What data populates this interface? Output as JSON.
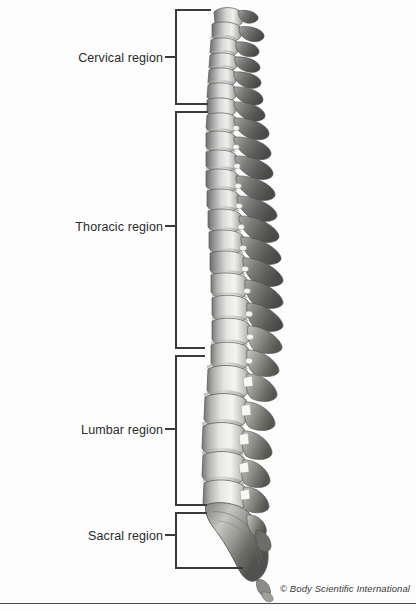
{
  "figure": {
    "copyright": "© Body Scientific International",
    "background_color": "#fdfdfd",
    "line_color": "#3b3b3b",
    "text_color": "#2b2b2b"
  },
  "labels": [
    {
      "id": "cervical",
      "text": "Cervical region",
      "text_right_x": 163,
      "text_center_y": 58,
      "tick_y": 57,
      "bracket_top_y": 10,
      "bracket_bottom_y": 104,
      "arm_top_x": 211,
      "arm_bottom_x": 208
    },
    {
      "id": "thoracic",
      "text": "Thoracic region",
      "text_right_x": 163,
      "text_center_y": 227,
      "tick_y": 226,
      "bracket_top_y": 112,
      "bracket_bottom_y": 348,
      "arm_top_x": 208,
      "arm_bottom_x": 205
    },
    {
      "id": "lumbar",
      "text": "Lumbar region",
      "text_right_x": 163,
      "text_center_y": 430,
      "tick_y": 429,
      "bracket_top_y": 356,
      "bracket_bottom_y": 505,
      "arm_top_x": 205,
      "arm_bottom_x": 207
    },
    {
      "id": "sacral",
      "text": "Sacral region",
      "text_right_x": 163,
      "text_center_y": 536,
      "tick_y": 535,
      "bracket_top_y": 513,
      "bracket_bottom_y": 568,
      "arm_top_x": 207,
      "arm_bottom_x": 243
    }
  ],
  "bracket_geometry": {
    "vertical_x": 176,
    "tick_left_x": 165,
    "tick_right_x": 176,
    "stroke_width": 1.1
  },
  "anatomy": {
    "view": "lateral (side) view",
    "regions": [
      {
        "name": "Cervical region",
        "vertebra_count": 7,
        "curvature": "lordosis (convex anteriorly)",
        "top_y": 8,
        "bottom_y": 106
      },
      {
        "name": "Thoracic region",
        "vertebra_count": 12,
        "curvature": "kyphosis (convex posteriorly)",
        "top_y": 106,
        "bottom_y": 350
      },
      {
        "name": "Lumbar region",
        "vertebra_count": 5,
        "curvature": "lordosis (convex anteriorly)",
        "top_y": 350,
        "bottom_y": 500
      },
      {
        "name": "Sacral region",
        "vertebra_count": 5,
        "curvature": "kyphosis (fused sacrum and coccyx)",
        "top_y": 500,
        "bottom_y": 595
      }
    ]
  }
}
